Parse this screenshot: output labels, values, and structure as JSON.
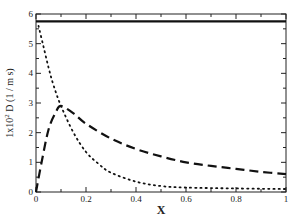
{
  "chart_data": {
    "type": "line",
    "title": "",
    "xlabel": "X",
    "ylabel": "1x10² D (1 / m s)",
    "ylabel_parts": {
      "prefix": "1x10",
      "sup": "2",
      "suffix": " D (1 / m s)"
    },
    "xlim": [
      0,
      1
    ],
    "ylim": [
      0,
      6
    ],
    "x_ticks": [
      0,
      0.2,
      0.4,
      0.6,
      0.8,
      1
    ],
    "x_tick_labels": [
      "0",
      "0.2",
      "0.4",
      "0.6",
      "0.8",
      "1"
    ],
    "x_minor_ticks": [
      0.1,
      0.3,
      0.5,
      0.7,
      0.9
    ],
    "y_ticks": [
      0,
      1,
      2,
      3,
      4,
      5,
      6
    ],
    "y_tick_labels": [
      "0",
      "1",
      "2",
      "3",
      "4",
      "5",
      "6"
    ],
    "y_minor_ticks": [
      0.5,
      1.5,
      2.5,
      3.5,
      4.5,
      5.5
    ],
    "grid": false,
    "legend": "none",
    "series": [
      {
        "name": "solid",
        "style": "solid",
        "color": "#111111",
        "x": [
          0,
          1
        ],
        "y": [
          5.75,
          5.75
        ]
      },
      {
        "name": "dashed",
        "style": "dashed",
        "color": "#111111",
        "x": [
          0,
          0.02,
          0.05,
          0.08,
          0.1,
          0.15,
          0.2,
          0.3,
          0.4,
          0.5,
          0.6,
          0.7,
          0.8,
          0.9,
          1.0
        ],
        "y": [
          0,
          0.9,
          2.1,
          2.7,
          2.9,
          2.65,
          2.3,
          1.8,
          1.45,
          1.2,
          1.0,
          0.88,
          0.78,
          0.68,
          0.6
        ]
      },
      {
        "name": "dotted",
        "style": "dotted",
        "color": "#111111",
        "x": [
          0.01,
          0.03,
          0.05,
          0.07,
          0.1,
          0.15,
          0.2,
          0.25,
          0.3,
          0.4,
          0.5,
          0.6,
          0.8,
          1.0
        ],
        "y": [
          5.6,
          4.9,
          4.2,
          3.6,
          2.9,
          2.0,
          1.35,
          0.95,
          0.65,
          0.35,
          0.2,
          0.15,
          0.12,
          0.1
        ]
      }
    ]
  }
}
